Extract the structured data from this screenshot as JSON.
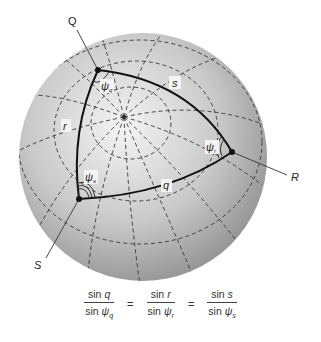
{
  "figure": {
    "type": "spherical triangle diagram",
    "vertices": [
      {
        "id": "Q",
        "label": "Q"
      },
      {
        "id": "R",
        "label": "R"
      },
      {
        "id": "S",
        "label": "S"
      }
    ],
    "sides": [
      {
        "id": "s",
        "label": "s",
        "between": [
          "Q",
          "R"
        ]
      },
      {
        "id": "r",
        "label": "r",
        "between": [
          "Q",
          "S"
        ]
      },
      {
        "id": "q",
        "label": "q",
        "between": [
          "S",
          "R"
        ]
      }
    ],
    "angles": [
      {
        "id": "psi_q",
        "symbol": "ψ",
        "sub": "q",
        "at": "Q",
        "arcs": 1
      },
      {
        "id": "psi_r",
        "symbol": "ψ",
        "sub": "r",
        "at": "R",
        "arcs": 2
      },
      {
        "id": "psi_s",
        "symbol": "ψ",
        "sub": "s",
        "at": "S",
        "arcs": 3
      }
    ],
    "colors": {
      "sphere_light": "#f2f2f2",
      "sphere_dark": "#8c8c8c",
      "grid": "#333333",
      "triangle": "#111111",
      "background": "#ffffff"
    }
  },
  "equation": {
    "terms": [
      {
        "num_fn": "sin",
        "num_var": "q",
        "den_fn": "sin",
        "den_var": "ψ",
        "den_sub": "q"
      },
      {
        "num_fn": "sin",
        "num_var": "r",
        "den_fn": "sin",
        "den_var": "ψ",
        "den_sub": "r"
      },
      {
        "num_fn": "sin",
        "num_var": "s",
        "den_fn": "sin",
        "den_var": "ψ",
        "den_sub": "s"
      }
    ],
    "equals": "="
  }
}
